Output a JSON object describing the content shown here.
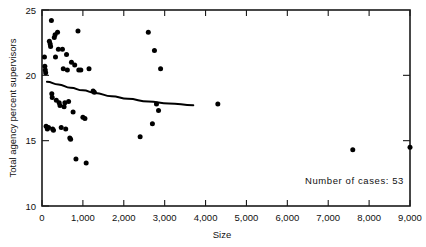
{
  "chart_data": {
    "type": "scatter",
    "title": "",
    "xlabel": "Size",
    "ylabel": "Total agency percent supervisors",
    "xlim": [
      0,
      9000
    ],
    "ylim": [
      10,
      25
    ],
    "xticks": [
      0,
      1000,
      2000,
      3000,
      4000,
      5000,
      6000,
      7000,
      8000,
      9000
    ],
    "xticklabels": [
      "0",
      "1,000",
      "2,000",
      "3,000",
      "4,000",
      "5,000",
      "6,000",
      "7,000",
      "8,000",
      "9,000"
    ],
    "yticks": [
      10,
      15,
      20,
      25
    ],
    "yticklabels": [
      "10",
      "15",
      "20",
      "25"
    ],
    "grid": false,
    "legend": null,
    "annotations": [
      {
        "text": "Number of cases: 53",
        "x": 7000,
        "y": 12.1
      }
    ],
    "marker_color": "#000000",
    "curve_color": "#000000",
    "points": [
      {
        "x": 60,
        "y": 21.4
      },
      {
        "x": 70,
        "y": 20.7
      },
      {
        "x": 80,
        "y": 20.4
      },
      {
        "x": 90,
        "y": 20.2
      },
      {
        "x": 100,
        "y": 16.1
      },
      {
        "x": 130,
        "y": 15.9
      },
      {
        "x": 160,
        "y": 16.0
      },
      {
        "x": 180,
        "y": 22.6
      },
      {
        "x": 200,
        "y": 22.4
      },
      {
        "x": 210,
        "y": 22.2
      },
      {
        "x": 230,
        "y": 24.2
      },
      {
        "x": 240,
        "y": 18.6
      },
      {
        "x": 250,
        "y": 18.3
      },
      {
        "x": 260,
        "y": 15.9
      },
      {
        "x": 280,
        "y": 15.8
      },
      {
        "x": 300,
        "y": 22.9
      },
      {
        "x": 320,
        "y": 23.1
      },
      {
        "x": 330,
        "y": 21.4
      },
      {
        "x": 350,
        "y": 18.1
      },
      {
        "x": 380,
        "y": 23.3
      },
      {
        "x": 400,
        "y": 22.0
      },
      {
        "x": 420,
        "y": 17.9
      },
      {
        "x": 440,
        "y": 17.7
      },
      {
        "x": 470,
        "y": 16.0
      },
      {
        "x": 500,
        "y": 22.0
      },
      {
        "x": 520,
        "y": 20.5
      },
      {
        "x": 540,
        "y": 17.6
      },
      {
        "x": 560,
        "y": 17.9
      },
      {
        "x": 580,
        "y": 15.9
      },
      {
        "x": 600,
        "y": 21.6
      },
      {
        "x": 620,
        "y": 20.4
      },
      {
        "x": 650,
        "y": 18.0
      },
      {
        "x": 680,
        "y": 15.2
      },
      {
        "x": 700,
        "y": 15.1
      },
      {
        "x": 720,
        "y": 21.0
      },
      {
        "x": 760,
        "y": 17.2
      },
      {
        "x": 800,
        "y": 20.8
      },
      {
        "x": 830,
        "y": 13.6
      },
      {
        "x": 880,
        "y": 23.4
      },
      {
        "x": 900,
        "y": 20.4
      },
      {
        "x": 950,
        "y": 20.4
      },
      {
        "x": 1000,
        "y": 16.8
      },
      {
        "x": 1050,
        "y": 16.7
      },
      {
        "x": 1080,
        "y": 13.3
      },
      {
        "x": 1150,
        "y": 20.5
      },
      {
        "x": 1250,
        "y": 18.8
      },
      {
        "x": 1280,
        "y": 18.7
      },
      {
        "x": 2400,
        "y": 15.3
      },
      {
        "x": 2600,
        "y": 23.3
      },
      {
        "x": 2700,
        "y": 16.3
      },
      {
        "x": 2750,
        "y": 21.9
      },
      {
        "x": 2800,
        "y": 17.8
      },
      {
        "x": 2850,
        "y": 17.3
      },
      {
        "x": 2900,
        "y": 20.5
      },
      {
        "x": 4300,
        "y": 17.8
      },
      {
        "x": 7600,
        "y": 14.3
      },
      {
        "x": 9000,
        "y": 14.5
      }
    ],
    "fit_curve": {
      "label": "smoothed trend",
      "points": [
        {
          "x": 120,
          "y": 19.5
        },
        {
          "x": 400,
          "y": 19.3
        },
        {
          "x": 700,
          "y": 19.05
        },
        {
          "x": 1000,
          "y": 18.85
        },
        {
          "x": 1300,
          "y": 18.65
        },
        {
          "x": 1700,
          "y": 18.4
        },
        {
          "x": 2100,
          "y": 18.2
        },
        {
          "x": 2600,
          "y": 18.0
        },
        {
          "x": 3100,
          "y": 17.85
        },
        {
          "x": 3700,
          "y": 17.72
        }
      ]
    }
  }
}
